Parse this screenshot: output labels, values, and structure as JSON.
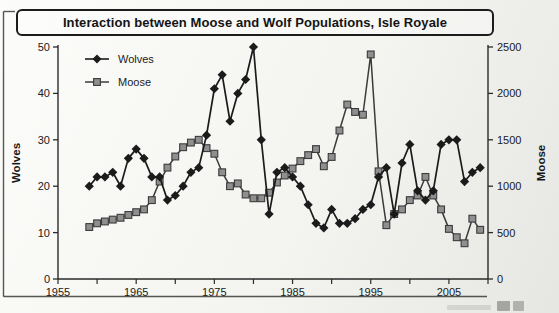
{
  "title": "Interaction between Moose and Wolf Populations, Isle Royale",
  "legend": {
    "position": "top-left"
  },
  "colors": {
    "ink": "#2a2a2a",
    "wolves": "#1b1b1b",
    "moose_fill": "#8f8f8f",
    "moose_stroke": "#3b3b3b",
    "background": "#f4f4f1"
  },
  "chart_data": {
    "type": "line",
    "title": "Interaction between Moose and Wolf Populations, Isle Royale",
    "x": [
      1959,
      1960,
      1961,
      1962,
      1963,
      1964,
      1965,
      1966,
      1967,
      1968,
      1969,
      1970,
      1971,
      1972,
      1973,
      1974,
      1975,
      1976,
      1977,
      1978,
      1979,
      1980,
      1981,
      1982,
      1983,
      1984,
      1985,
      1986,
      1987,
      1988,
      1989,
      1990,
      1991,
      1992,
      1993,
      1994,
      1995,
      1996,
      1997,
      1998,
      1999,
      2000,
      2001,
      2002,
      2003,
      2004,
      2005,
      2006,
      2007,
      2008,
      2009
    ],
    "series": [
      {
        "name": "Wolves",
        "axis": "left",
        "marker": "diamond",
        "color": "#1b1b1b",
        "stroke": "#1b1b1b",
        "values": [
          20,
          22,
          22,
          23,
          20,
          26,
          28,
          26,
          22,
          22,
          17,
          18,
          20,
          23,
          24,
          31,
          41,
          44,
          34,
          40,
          43,
          50,
          30,
          14,
          23,
          24,
          22,
          20,
          16,
          12,
          11,
          15,
          12,
          12,
          13,
          15,
          16,
          22,
          24,
          14,
          25,
          29,
          19,
          17,
          19,
          29,
          30,
          30,
          21,
          23,
          24
        ]
      },
      {
        "name": "Moose",
        "axis": "right",
        "marker": "square",
        "color": "#8f8f8f",
        "stroke": "#3b3b3b",
        "values": [
          560,
          600,
          620,
          640,
          660,
          690,
          720,
          750,
          850,
          1050,
          1200,
          1320,
          1420,
          1470,
          1500,
          1410,
          1350,
          1150,
          1000,
          1030,
          910,
          870,
          870,
          930,
          1040,
          1115,
          1190,
          1270,
          1335,
          1400,
          1215,
          1315,
          1600,
          1880,
          1800,
          1770,
          2420,
          1160,
          580,
          700,
          750,
          850,
          900,
          1100,
          900,
          750,
          540,
          450,
          385,
          650,
          530
        ]
      }
    ],
    "xlim": [
      1955,
      2010
    ],
    "x_major_ticks": [
      "1955",
      "1965",
      "1975",
      "1985",
      "1995",
      "2005"
    ],
    "x_minor_tick_step": 5,
    "left_axis": {
      "label": "Wolves",
      "ticks": [
        0,
        10,
        20,
        30,
        40,
        50
      ],
      "lim": [
        0,
        50
      ]
    },
    "right_axis": {
      "label": "Moose",
      "ticks": [
        0,
        500,
        1000,
        1500,
        2000,
        2500
      ],
      "lim": [
        0,
        2500
      ]
    },
    "legend_position": "top-left",
    "grid": false
  }
}
